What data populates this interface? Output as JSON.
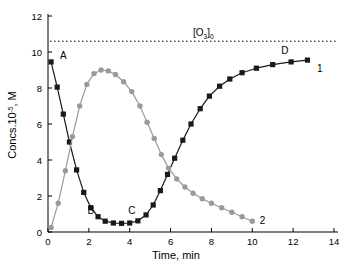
{
  "chart_data": {
    "type": "line",
    "title": "",
    "xlabel": "Time, min",
    "ylabel": "Concs.10",
    "ylabel_exp": "-5",
    "ylabel_tail": ", M",
    "xlim": [
      0,
      14
    ],
    "ylim": [
      0,
      12
    ],
    "xticks": [
      "0",
      "2",
      "4",
      "6",
      "8",
      "10",
      "12",
      "14"
    ],
    "yticks": [
      "0",
      "2",
      "4",
      "6",
      "8",
      "10",
      "12"
    ],
    "grid": false,
    "legend": "none",
    "reference_line": {
      "label": "[O",
      "label_sub": "3",
      "label_sub2": "0",
      "label_close": "]",
      "value": 10.6,
      "style": "dotted"
    },
    "annotations": [
      {
        "text": "A",
        "x": 0.75,
        "y": 9.6
      },
      {
        "text": "B",
        "x": 2.1,
        "y": 1.0
      },
      {
        "text": "C",
        "x": 4.1,
        "y": 1.0
      },
      {
        "text": "D",
        "x": 11.6,
        "y": 9.9
      },
      {
        "text": "1",
        "x": 13.3,
        "y": 8.9
      },
      {
        "text": "2",
        "x": 10.5,
        "y": 0.45
      }
    ],
    "series": [
      {
        "name": "1",
        "marker": "square",
        "color": "#1a1a1a",
        "points": [
          [
            0.15,
            9.45
          ],
          [
            0.45,
            8.05
          ],
          [
            0.75,
            6.55
          ],
          [
            1.05,
            5.0
          ],
          [
            1.4,
            3.45
          ],
          [
            1.75,
            2.2
          ],
          [
            2.1,
            1.35
          ],
          [
            2.45,
            0.85
          ],
          [
            2.8,
            0.6
          ],
          [
            3.2,
            0.5
          ],
          [
            3.6,
            0.48
          ],
          [
            4.0,
            0.5
          ],
          [
            4.4,
            0.62
          ],
          [
            4.8,
            0.95
          ],
          [
            5.15,
            1.5
          ],
          [
            5.5,
            2.3
          ],
          [
            5.85,
            3.2
          ],
          [
            6.2,
            4.1
          ],
          [
            6.6,
            5.1
          ],
          [
            7.0,
            6.0
          ],
          [
            7.45,
            6.85
          ],
          [
            7.9,
            7.55
          ],
          [
            8.4,
            8.1
          ],
          [
            8.9,
            8.5
          ],
          [
            9.5,
            8.85
          ],
          [
            10.2,
            9.1
          ],
          [
            11.0,
            9.3
          ],
          [
            11.9,
            9.45
          ],
          [
            12.7,
            9.55
          ]
        ]
      },
      {
        "name": "2",
        "marker": "circle",
        "color": "#9a9a9a",
        "points": [
          [
            0.15,
            0.25
          ],
          [
            0.5,
            1.6
          ],
          [
            0.85,
            3.4
          ],
          [
            1.2,
            5.3
          ],
          [
            1.55,
            7.0
          ],
          [
            1.9,
            8.2
          ],
          [
            2.25,
            8.8
          ],
          [
            2.6,
            9.0
          ],
          [
            2.95,
            8.95
          ],
          [
            3.3,
            8.75
          ],
          [
            3.7,
            8.35
          ],
          [
            4.1,
            7.8
          ],
          [
            4.5,
            7.0
          ],
          [
            4.85,
            6.1
          ],
          [
            5.2,
            5.2
          ],
          [
            5.55,
            4.3
          ],
          [
            5.9,
            3.55
          ],
          [
            6.3,
            2.95
          ],
          [
            6.7,
            2.5
          ],
          [
            7.1,
            2.15
          ],
          [
            7.55,
            1.85
          ],
          [
            8.0,
            1.6
          ],
          [
            8.5,
            1.35
          ],
          [
            9.0,
            1.1
          ],
          [
            9.5,
            0.85
          ],
          [
            10.0,
            0.6
          ]
        ]
      }
    ]
  },
  "axis": {
    "xlabel": "Time, min",
    "ylabel_main": "Concs.10",
    "ylabel_sup": "-5",
    "ylabel_end": ", M"
  }
}
